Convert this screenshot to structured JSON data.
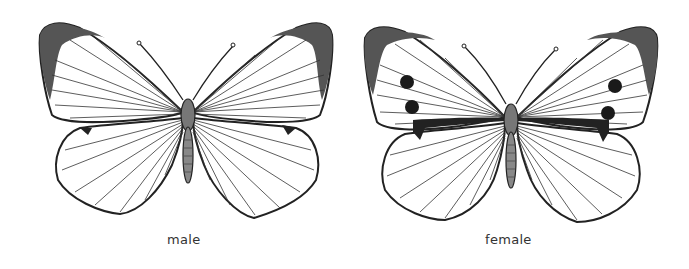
{
  "figures": [
    {
      "id": "male",
      "caption": "male",
      "features": [
        "dark forewing apex tips",
        "no forewing spots",
        "small hindwing costal mark"
      ]
    },
    {
      "id": "female",
      "caption": "female",
      "features": [
        "dark forewing apex tips",
        "two black spots on each forewing",
        "dark dash along forewing inner margin",
        "small hindwing costal mark"
      ]
    }
  ],
  "colors": {
    "outline": "#222222",
    "apex": "#555555",
    "body": "#777777",
    "spot": "#1a1a1a",
    "wing": "#ffffff"
  }
}
